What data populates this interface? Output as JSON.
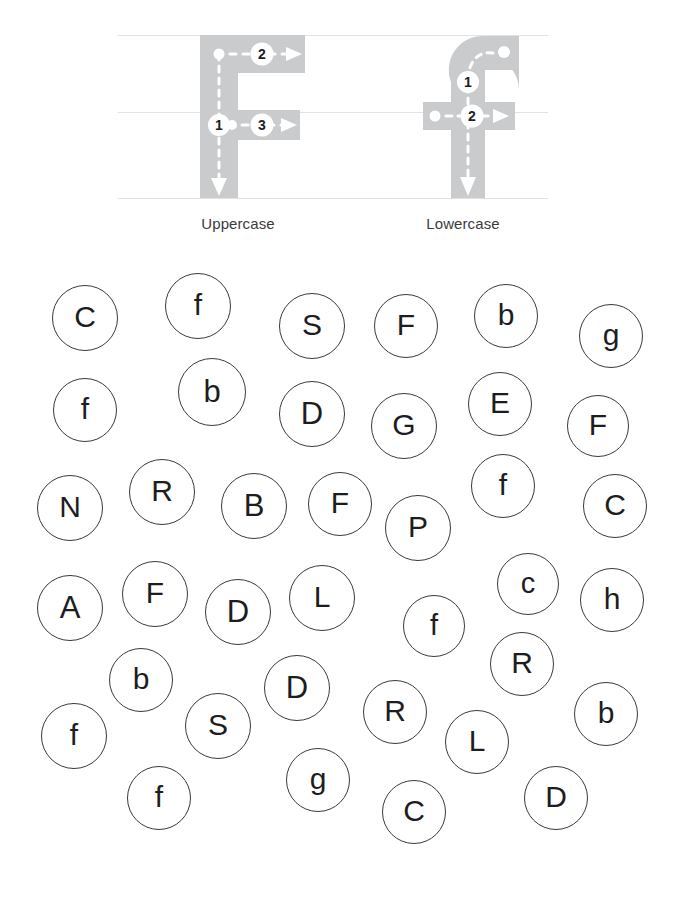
{
  "worksheet": {
    "title": "Letter F stroke-order and find-the-letter circles worksheet",
    "background_color": "#ffffff",
    "ink_color": "#1d1d1f",
    "circle_stroke_color": "#3a3a3c",
    "letter_body_color": "#c9cbcc",
    "guide_line_color": "#e3e3e5",
    "stroke_path_color": "#ffffff",
    "step_badge_color": "#ffffff",
    "step_badge_text_color": "#1d1d1f"
  },
  "stroke_panel": {
    "guide_lines": [
      {
        "name": "ascender-line",
        "y": 35
      },
      {
        "name": "midline",
        "y": 112
      },
      {
        "name": "baseline",
        "y": 198
      }
    ],
    "demos": [
      {
        "id": "uppercase-f",
        "caption": "Uppercase",
        "letter": "F",
        "steps": [
          {
            "number": "1",
            "direction": "down",
            "description": "Vertical stem, top to bottom"
          },
          {
            "number": "2",
            "direction": "right",
            "description": "Top horizontal bar, left to right"
          },
          {
            "number": "3",
            "direction": "right",
            "description": "Middle horizontal bar, left to right"
          }
        ]
      },
      {
        "id": "lowercase-f",
        "caption": "Lowercase",
        "letter": "f",
        "steps": [
          {
            "number": "1",
            "direction": "curve-down",
            "description": "Hook from top curve down through the stem"
          },
          {
            "number": "2",
            "direction": "right",
            "description": "Cross bar, left to right"
          }
        ]
      }
    ]
  },
  "circle_field": {
    "instruction_implied": "Find and mark every F and f",
    "target_letters": [
      "F",
      "f"
    ],
    "count": 38,
    "circles": [
      {
        "label": "C",
        "case": "upper",
        "x": 85,
        "y": 70,
        "r": 33,
        "size": 30
      },
      {
        "label": "f",
        "case": "lower",
        "x": 198,
        "y": 58,
        "r": 33,
        "size": 30
      },
      {
        "label": "S",
        "case": "upper",
        "x": 312,
        "y": 78,
        "r": 33,
        "size": 30
      },
      {
        "label": "F",
        "case": "upper",
        "x": 406,
        "y": 78,
        "r": 32,
        "size": 30
      },
      {
        "label": "b",
        "case": "lower",
        "x": 506,
        "y": 68,
        "r": 32,
        "size": 30
      },
      {
        "label": "g",
        "case": "lower",
        "x": 611,
        "y": 88,
        "r": 32,
        "size": 30
      },
      {
        "label": "f",
        "case": "lower",
        "x": 85,
        "y": 162,
        "r": 32,
        "size": 30
      },
      {
        "label": "b",
        "case": "lower",
        "x": 212,
        "y": 144,
        "r": 34,
        "size": 31
      },
      {
        "label": "D",
        "case": "upper",
        "x": 312,
        "y": 166,
        "r": 33,
        "size": 31
      },
      {
        "label": "G",
        "case": "upper",
        "x": 404,
        "y": 178,
        "r": 33,
        "size": 30
      },
      {
        "label": "E",
        "case": "upper",
        "x": 500,
        "y": 156,
        "r": 32,
        "size": 30
      },
      {
        "label": "F",
        "case": "upper",
        "x": 598,
        "y": 178,
        "r": 31,
        "size": 30
      },
      {
        "label": "N",
        "case": "upper",
        "x": 70,
        "y": 260,
        "r": 33,
        "size": 30
      },
      {
        "label": "R",
        "case": "upper",
        "x": 162,
        "y": 244,
        "r": 33,
        "size": 30
      },
      {
        "label": "B",
        "case": "upper",
        "x": 254,
        "y": 258,
        "r": 33,
        "size": 31
      },
      {
        "label": "F",
        "case": "upper",
        "x": 340,
        "y": 256,
        "r": 32,
        "size": 30
      },
      {
        "label": "P",
        "case": "upper",
        "x": 418,
        "y": 280,
        "r": 33,
        "size": 30
      },
      {
        "label": "f",
        "case": "lower",
        "x": 503,
        "y": 238,
        "r": 32,
        "size": 30
      },
      {
        "label": "C",
        "case": "upper",
        "x": 615,
        "y": 258,
        "r": 32,
        "size": 30
      },
      {
        "label": "A",
        "case": "upper",
        "x": 70,
        "y": 360,
        "r": 33,
        "size": 31
      },
      {
        "label": "F",
        "case": "upper",
        "x": 155,
        "y": 346,
        "r": 33,
        "size": 30
      },
      {
        "label": "D",
        "case": "upper",
        "x": 238,
        "y": 364,
        "r": 33,
        "size": 31
      },
      {
        "label": "L",
        "case": "upper",
        "x": 322,
        "y": 350,
        "r": 33,
        "size": 30
      },
      {
        "label": "f",
        "case": "lower",
        "x": 434,
        "y": 378,
        "r": 31,
        "size": 29
      },
      {
        "label": "c",
        "case": "lower",
        "x": 528,
        "y": 336,
        "r": 31,
        "size": 29
      },
      {
        "label": "h",
        "case": "lower",
        "x": 612,
        "y": 352,
        "r": 32,
        "size": 30
      },
      {
        "label": "b",
        "case": "lower",
        "x": 141,
        "y": 432,
        "r": 32,
        "size": 30
      },
      {
        "label": "D",
        "case": "upper",
        "x": 297,
        "y": 440,
        "r": 33,
        "size": 31
      },
      {
        "label": "R",
        "case": "upper",
        "x": 522,
        "y": 416,
        "r": 32,
        "size": 30
      },
      {
        "label": "b",
        "case": "lower",
        "x": 606,
        "y": 466,
        "r": 32,
        "size": 30
      },
      {
        "label": "f",
        "case": "lower",
        "x": 74,
        "y": 488,
        "r": 33,
        "size": 30
      },
      {
        "label": "S",
        "case": "upper",
        "x": 218,
        "y": 478,
        "r": 33,
        "size": 30
      },
      {
        "label": "R",
        "case": "upper",
        "x": 395,
        "y": 464,
        "r": 32,
        "size": 30
      },
      {
        "label": "L",
        "case": "upper",
        "x": 477,
        "y": 494,
        "r": 32,
        "size": 30
      },
      {
        "label": "f",
        "case": "lower",
        "x": 159,
        "y": 550,
        "r": 32,
        "size": 30
      },
      {
        "label": "g",
        "case": "lower",
        "x": 318,
        "y": 532,
        "r": 32,
        "size": 30
      },
      {
        "label": "C",
        "case": "upper",
        "x": 414,
        "y": 564,
        "r": 32,
        "size": 30
      },
      {
        "label": "D",
        "case": "upper",
        "x": 556,
        "y": 550,
        "r": 32,
        "size": 30
      }
    ]
  }
}
